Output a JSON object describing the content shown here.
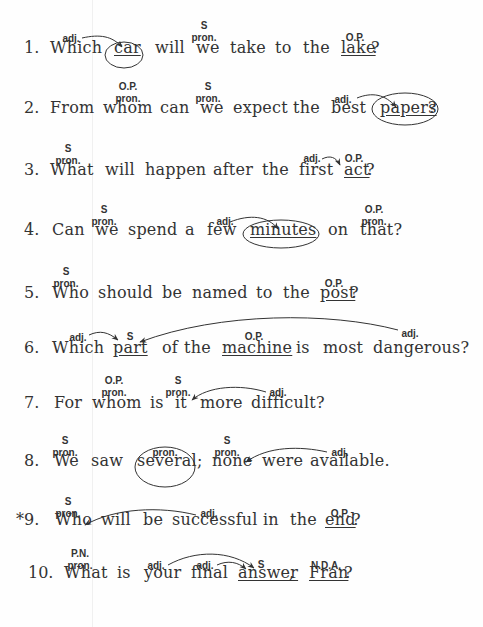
{
  "exercise": {
    "sentences": [
      {
        "number": "1.",
        "y": 50,
        "words": [
          {
            "t": "Which",
            "x": 50
          },
          {
            "t": "car",
            "x": 114,
            "u": true
          },
          {
            "t": "will",
            "x": 155
          },
          {
            "t": "we",
            "x": 196
          },
          {
            "t": "take",
            "x": 230
          },
          {
            "t": "to",
            "x": 275
          },
          {
            "t": "the",
            "x": 303
          },
          {
            "t": "lake",
            "x": 341,
            "u": true
          },
          {
            "t": "?",
            "x": 371
          }
        ],
        "labels": [
          {
            "t": "adj.",
            "x": 71,
            "y": 39
          },
          {
            "t": "S",
            "x": 204,
            "y": 26
          },
          {
            "t": "pron.",
            "x": 204,
            "y": 38
          },
          {
            "t": "O.P.",
            "x": 355,
            "y": 38
          }
        ],
        "circled": [
          "car"
        ]
      },
      {
        "number": "2.",
        "y": 110,
        "words": [
          {
            "t": "From",
            "x": 50
          },
          {
            "t": "whom",
            "x": 103
          },
          {
            "t": "can",
            "x": 160
          },
          {
            "t": "we",
            "x": 200
          },
          {
            "t": "expect",
            "x": 233
          },
          {
            "t": "the",
            "x": 293
          },
          {
            "t": "best",
            "x": 331
          },
          {
            "t": "papers",
            "x": 380,
            "u": true
          },
          {
            "t": "?",
            "x": 428
          }
        ],
        "labels": [
          {
            "t": "O.P.",
            "x": 128,
            "y": 87
          },
          {
            "t": "pron.",
            "x": 128,
            "y": 99
          },
          {
            "t": "S",
            "x": 208,
            "y": 87
          },
          {
            "t": "pron.",
            "x": 208,
            "y": 99
          },
          {
            "t": "adj.",
            "x": 343,
            "y": 100
          }
        ],
        "circled": [
          "papers?"
        ]
      },
      {
        "number": "3.",
        "y": 172,
        "words": [
          {
            "t": "What",
            "x": 50
          },
          {
            "t": "will",
            "x": 105
          },
          {
            "t": "happen",
            "x": 145
          },
          {
            "t": "after",
            "x": 213
          },
          {
            "t": "the",
            "x": 262
          },
          {
            "t": "first",
            "x": 299
          },
          {
            "t": "act",
            "x": 344,
            "u": true
          },
          {
            "t": "?",
            "x": 366
          }
        ],
        "labels": [
          {
            "t": "S",
            "x": 68,
            "y": 149
          },
          {
            "t": "pron.",
            "x": 68,
            "y": 161
          },
          {
            "t": "adj.",
            "x": 312,
            "y": 159
          },
          {
            "t": "O.P.",
            "x": 354,
            "y": 159
          }
        ],
        "circled": []
      },
      {
        "number": "4.",
        "y": 232,
        "words": [
          {
            "t": "Can",
            "x": 52
          },
          {
            "t": "we",
            "x": 95
          },
          {
            "t": "spend",
            "x": 128
          },
          {
            "t": "a",
            "x": 185
          },
          {
            "t": "few",
            "x": 207
          },
          {
            "t": "minutes",
            "x": 250,
            "u": true
          },
          {
            "t": "on",
            "x": 328
          },
          {
            "t": "that?",
            "x": 360
          }
        ],
        "labels": [
          {
            "t": "S",
            "x": 104,
            "y": 210
          },
          {
            "t": "pron.",
            "x": 104,
            "y": 222
          },
          {
            "t": "adj.",
            "x": 225,
            "y": 222
          },
          {
            "t": "O.P.",
            "x": 374,
            "y": 210
          },
          {
            "t": "pron.",
            "x": 374,
            "y": 222
          }
        ],
        "circled": [
          "minutes"
        ]
      },
      {
        "number": "5.",
        "y": 295,
        "words": [
          {
            "t": "Who",
            "x": 52
          },
          {
            "t": "should",
            "x": 98
          },
          {
            "t": "be",
            "x": 162
          },
          {
            "t": "named",
            "x": 192
          },
          {
            "t": "to",
            "x": 256
          },
          {
            "t": "the",
            "x": 283
          },
          {
            "t": "post",
            "x": 320,
            "u": true
          },
          {
            "t": "?",
            "x": 350
          }
        ],
        "labels": [
          {
            "t": "S",
            "x": 66,
            "y": 272
          },
          {
            "t": "pron.",
            "x": 66,
            "y": 284
          },
          {
            "t": "O.P.",
            "x": 334,
            "y": 284
          }
        ],
        "circled": []
      },
      {
        "number": "6.",
        "y": 350,
        "words": [
          {
            "t": "Which",
            "x": 52
          },
          {
            "t": "part",
            "x": 113,
            "u": true
          },
          {
            "t": "of",
            "x": 162
          },
          {
            "t": "the",
            "x": 184
          },
          {
            "t": "machine",
            "x": 222,
            "u": true
          },
          {
            "t": "is",
            "x": 296
          },
          {
            "t": "most",
            "x": 323
          },
          {
            "t": "dangerous?",
            "x": 373
          }
        ],
        "labels": [
          {
            "t": "adj.",
            "x": 78,
            "y": 338
          },
          {
            "t": "S",
            "x": 130,
            "y": 337
          },
          {
            "t": "O.P.",
            "x": 254,
            "y": 337
          },
          {
            "t": "adj.",
            "x": 410,
            "y": 334
          }
        ],
        "circled": []
      },
      {
        "number": "7.",
        "y": 405,
        "words": [
          {
            "t": "For",
            "x": 54
          },
          {
            "t": "whom",
            "x": 92
          },
          {
            "t": "is",
            "x": 150
          },
          {
            "t": "it",
            "x": 175
          },
          {
            "t": "more",
            "x": 200
          },
          {
            "t": "difficult?",
            "x": 251
          }
        ],
        "labels": [
          {
            "t": "O.P.",
            "x": 114,
            "y": 381
          },
          {
            "t": "pron.",
            "x": 114,
            "y": 393
          },
          {
            "t": "S",
            "x": 178,
            "y": 381
          },
          {
            "t": "pron.",
            "x": 178,
            "y": 393
          },
          {
            "t": "adj.",
            "x": 278,
            "y": 393
          }
        ],
        "circled": []
      },
      {
        "number": "8.",
        "y": 463,
        "words": [
          {
            "t": "We",
            "x": 54
          },
          {
            "t": "saw",
            "x": 91
          },
          {
            "t": "several;",
            "x": 137
          },
          {
            "t": "none",
            "x": 212
          },
          {
            "t": "were",
            "x": 262
          },
          {
            "t": "available.",
            "x": 310
          }
        ],
        "labels": [
          {
            "t": "S",
            "x": 65,
            "y": 441
          },
          {
            "t": "pron.",
            "x": 65,
            "y": 453
          },
          {
            "t": "pron.",
            "x": 165,
            "y": 453
          },
          {
            "t": "S",
            "x": 227,
            "y": 441
          },
          {
            "t": "pron.",
            "x": 227,
            "y": 453
          },
          {
            "t": "adj.",
            "x": 340,
            "y": 453
          }
        ],
        "circled": [
          "several;"
        ]
      },
      {
        "number": "*9.",
        "y": 522,
        "words": [
          {
            "t": "Who",
            "x": 55
          },
          {
            "t": "will",
            "x": 101
          },
          {
            "t": "be",
            "x": 143
          },
          {
            "t": "successful",
            "x": 172
          },
          {
            "t": "in",
            "x": 263
          },
          {
            "t": "the",
            "x": 290
          },
          {
            "t": "end",
            "x": 325,
            "u": true
          },
          {
            "t": "?",
            "x": 352
          }
        ],
        "labels": [
          {
            "t": "S",
            "x": 68,
            "y": 502
          },
          {
            "t": "pron.",
            "x": 68,
            "y": 514
          },
          {
            "t": "adj.",
            "x": 209,
            "y": 514
          },
          {
            "t": "O.P.",
            "x": 340,
            "y": 514
          }
        ],
        "circled": []
      },
      {
        "number": "10.",
        "y": 575,
        "words": [
          {
            "t": "What",
            "x": 64
          },
          {
            "t": "is",
            "x": 117
          },
          {
            "t": "your",
            "x": 144
          },
          {
            "t": "final",
            "x": 191
          },
          {
            "t": "answer",
            "x": 238,
            "u": true
          },
          {
            "t": ",",
            "x": 289
          },
          {
            "t": "Fran",
            "x": 309,
            "u": true
          },
          {
            "t": "?",
            "x": 344
          }
        ],
        "labels": [
          {
            "t": "P.N.",
            "x": 80,
            "y": 554
          },
          {
            "t": "pron.",
            "x": 80,
            "y": 566
          },
          {
            "t": "adj.",
            "x": 156,
            "y": 566
          },
          {
            "t": "adj.",
            "x": 205,
            "y": 566
          },
          {
            "t": "S",
            "x": 261,
            "y": 565
          },
          {
            "t": "N.D.A.",
            "x": 326,
            "y": 566
          }
        ],
        "circled": []
      }
    ]
  },
  "colors": {
    "ink": "#333333",
    "background": "#fefefe"
  }
}
